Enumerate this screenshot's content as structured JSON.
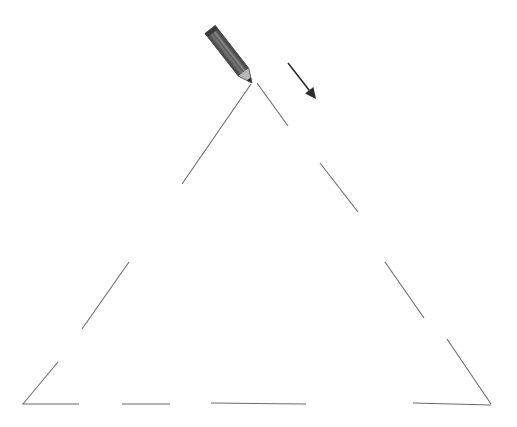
{
  "canvas": {
    "width": 517,
    "height": 427,
    "background": "#ffffff",
    "title": "Trace the triangle worksheet"
  },
  "style": {
    "stroke_color": "#6b6b6b",
    "stroke_width": 1.1,
    "arrow_color": "#2b2b2b",
    "arrow_width": 1.6,
    "pencil_body_dark": "#4a4a4a",
    "pencil_body_mid": "#5f5f5f",
    "pencil_body_light": "#8a8a8a",
    "pencil_tip_wood": "#b8b8b8",
    "pencil_tip_lead": "#2b2b2b",
    "pencil_ferrule": "#3a3a3a"
  },
  "shape": {
    "name": "triangle",
    "description": "Dashed/broken outline of an equilateral triangle to be traced",
    "apex": {
      "x": 253,
      "y": 82
    },
    "bottom_left": {
      "x": 22,
      "y": 405
    },
    "bottom_right": {
      "x": 491,
      "y": 405
    },
    "segments": [
      {
        "id": "left-edge-seg-1",
        "side": "left",
        "x1": 251,
        "y1": 84,
        "x2": 182,
        "y2": 184
      },
      {
        "id": "left-edge-seg-2",
        "side": "left",
        "x1": 129,
        "y1": 262,
        "x2": 82,
        "y2": 329
      },
      {
        "id": "left-edge-seg-3",
        "side": "left",
        "x1": 58,
        "y1": 362,
        "x2": 23,
        "y2": 404
      },
      {
        "id": "bottom-edge-seg-1",
        "side": "bottom",
        "x1": 22,
        "y1": 404,
        "x2": 79,
        "y2": 404
      },
      {
        "id": "bottom-edge-seg-2",
        "side": "bottom",
        "x1": 122,
        "y1": 404,
        "x2": 170,
        "y2": 404
      },
      {
        "id": "bottom-edge-seg-3",
        "side": "bottom",
        "x1": 211,
        "y1": 403,
        "x2": 306,
        "y2": 404
      },
      {
        "id": "bottom-edge-seg-4",
        "side": "bottom",
        "x1": 413,
        "y1": 403,
        "x2": 491,
        "y2": 405
      },
      {
        "id": "right-edge-seg-1",
        "side": "right",
        "x1": 257,
        "y1": 83,
        "x2": 288,
        "y2": 126
      },
      {
        "id": "right-edge-seg-2",
        "side": "right",
        "x1": 320,
        "y1": 163,
        "x2": 358,
        "y2": 212
      },
      {
        "id": "right-edge-seg-3",
        "side": "right",
        "x1": 385,
        "y1": 262,
        "x2": 424,
        "y2": 318
      },
      {
        "id": "right-edge-seg-4",
        "side": "right",
        "x1": 447,
        "y1": 339,
        "x2": 491,
        "y2": 404
      }
    ]
  },
  "pencil": {
    "name": "pencil-tool",
    "tip": {
      "x": 252,
      "y": 83
    },
    "eraser_end": {
      "x": 211,
      "y": 30
    },
    "angle_degrees": 52,
    "length": 68,
    "width": 13
  },
  "direction_arrow": {
    "name": "direction-arrow",
    "label": "stroke direction",
    "start": {
      "x": 288,
      "y": 63
    },
    "end": {
      "x": 316,
      "y": 99
    },
    "head_size": 11,
    "angle_degrees": 52
  }
}
